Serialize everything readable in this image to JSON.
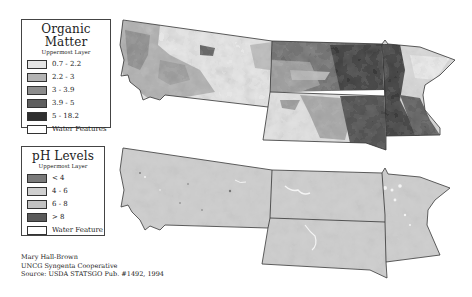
{
  "organic_matter_legend": {
    "title": "Organic Matter",
    "subtitle": "Uppermost Layer",
    "items": [
      {
        "label": "0.7 - 2.2",
        "color": "#e4e4e4"
      },
      {
        "label": "2.2 - 3",
        "color": "#b4b4b4"
      },
      {
        "label": "3 - 3.9",
        "color": "#8c8c8c"
      },
      {
        "label": "3.9 - 5",
        "color": "#5e5e5e"
      },
      {
        "label": "5 - 18.2",
        "color": "#2e2e2e"
      },
      {
        "label": "Water Features",
        "color": "#ffffff"
      }
    ]
  },
  "ph_legend": {
    "title": "pH Levels",
    "subtitle": "Uppermost Layer",
    "items": [
      {
        "label": "< 4",
        "color": "#7a7a7a"
      },
      {
        "label": "4 - 6",
        "color": "#cfcfcf"
      },
      {
        "label": "6 - 8",
        "color": "#c2c2c2"
      },
      {
        "label": "> 8",
        "color": "#5a5a5a"
      },
      {
        "label": "Water Feature",
        "color": "#ffffff"
      }
    ]
  },
  "maps": {
    "states": [
      "Montana",
      "North Dakota",
      "South Dakota",
      "Minnesota"
    ]
  },
  "credits": {
    "author": "Mary Hall-Brown",
    "organization": "UNCG Syngenta Cooperative",
    "source": "Source: USDA STATSGO Pub. #1492, 1994"
  }
}
